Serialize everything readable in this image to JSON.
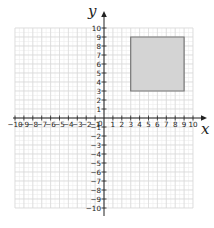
{
  "chart_data": {
    "type": "coordinate-grid",
    "title": "",
    "xlabel": "x",
    "ylabel": "y",
    "xlim": [
      -10,
      10
    ],
    "ylim": [
      -10,
      10
    ],
    "grid": true,
    "minor_grid": 0.5,
    "x_ticks": [
      -10,
      -9,
      -8,
      -7,
      -6,
      -5,
      -4,
      -3,
      -2,
      -1,
      1,
      2,
      3,
      4,
      5,
      6,
      7,
      8,
      9,
      10
    ],
    "y_ticks": [
      10,
      9,
      8,
      7,
      6,
      5,
      4,
      3,
      2,
      1,
      -1,
      -2,
      -3,
      -4,
      -5,
      -6,
      -7,
      -8,
      -9,
      -10
    ],
    "origin_label": "0",
    "shapes": [
      {
        "type": "rectangle",
        "vertices": [
          [
            3,
            3
          ],
          [
            9,
            3
          ],
          [
            9,
            9
          ],
          [
            3,
            9
          ]
        ],
        "fill": "#d4d4d4",
        "stroke": "#777777"
      }
    ]
  },
  "colors": {
    "grid_major": "#d8d8d8",
    "grid_minor": "#ececec",
    "axis": "#222222"
  }
}
